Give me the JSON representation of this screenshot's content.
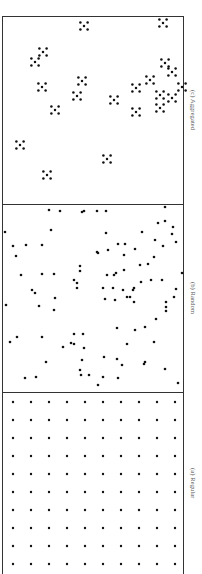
{
  "figure": {
    "panels": [
      {
        "id": "c",
        "label": "(c) Aggregated",
        "pattern": "aggregated",
        "cluster_centers_px": [
          [
            84,
            26
          ],
          [
            43,
            52
          ],
          [
            35,
            62
          ],
          [
            42,
            87
          ],
          [
            82,
            81
          ],
          [
            77,
            96
          ],
          [
            55,
            110
          ],
          [
            20,
            145
          ],
          [
            47,
            175
          ],
          [
            107,
            159
          ],
          [
            114,
            100
          ],
          [
            136,
            88
          ],
          [
            136,
            112
          ],
          [
            150,
            80
          ],
          [
            165,
            63
          ],
          [
            172,
            72
          ],
          [
            160,
            95
          ],
          [
            160,
            108
          ],
          [
            172,
            98
          ],
          [
            182,
            87
          ],
          [
            163,
            23
          ]
        ],
        "cluster_shape": "quincunx-5"
      },
      {
        "id": "b",
        "label": "(b) Random",
        "pattern": "random",
        "points_px": [
          [
            49,
            210
          ],
          [
            60,
            211
          ],
          [
            82,
            212
          ],
          [
            84,
            211
          ],
          [
            97,
            211
          ],
          [
            106,
            211
          ],
          [
            165,
            207
          ],
          [
            5,
            232
          ],
          [
            51,
            230
          ],
          [
            142,
            232
          ],
          [
            13,
            246
          ],
          [
            26,
            245
          ],
          [
            42,
            245
          ],
          [
            16,
            256
          ],
          [
            158,
            223
          ],
          [
            165,
            221
          ],
          [
            173,
            227
          ],
          [
            106,
            233
          ],
          [
            118,
            244
          ],
          [
            125,
            244
          ],
          [
            155,
            240
          ],
          [
            163,
            246
          ],
          [
            172,
            234
          ],
          [
            176,
            242
          ],
          [
            108,
            250
          ],
          [
            98,
            253
          ],
          [
            124,
            255
          ],
          [
            135,
            249
          ],
          [
            97,
            252
          ],
          [
            21,
            275
          ],
          [
            42,
            274
          ],
          [
            54,
            274
          ],
          [
            80,
            266
          ],
          [
            80,
            271
          ],
          [
            74,
            280
          ],
          [
            77,
            283
          ],
          [
            77,
            288
          ],
          [
            116,
            273
          ],
          [
            140,
            265
          ],
          [
            148,
            264
          ],
          [
            154,
            257
          ],
          [
            124,
            270
          ],
          [
            114,
            275
          ],
          [
            107,
            275
          ],
          [
            151,
            280
          ],
          [
            162,
            280
          ],
          [
            182,
            273
          ],
          [
            32,
            290
          ],
          [
            35,
            293
          ],
          [
            55,
            298
          ],
          [
            103,
            288
          ],
          [
            113,
            288
          ],
          [
            123,
            290
          ],
          [
            134,
            288
          ],
          [
            141,
            282
          ],
          [
            133,
            290
          ],
          [
            176,
            289
          ],
          [
            174,
            297
          ],
          [
            127,
            297
          ],
          [
            130,
            297
          ],
          [
            6,
            305
          ],
          [
            39,
            306
          ],
          [
            54,
            310
          ],
          [
            105,
            299
          ],
          [
            115,
            300
          ],
          [
            134,
            302
          ],
          [
            166,
            302
          ],
          [
            166,
            307
          ],
          [
            166,
            311
          ],
          [
            17,
            337
          ],
          [
            10,
            342
          ],
          [
            42,
            337
          ],
          [
            74,
            334
          ],
          [
            83,
            334
          ],
          [
            71,
            343
          ],
          [
            74,
            344
          ],
          [
            84,
            348
          ],
          [
            63,
            347
          ],
          [
            156,
            319
          ],
          [
            135,
            330
          ],
          [
            145,
            327
          ],
          [
            117,
            328
          ],
          [
            127,
            344
          ],
          [
            154,
            342
          ],
          [
            46,
            362
          ],
          [
            82,
            360
          ],
          [
            104,
            357
          ],
          [
            117,
            359
          ],
          [
            145,
            362
          ],
          [
            122,
            365
          ],
          [
            144,
            364
          ],
          [
            165,
            369
          ],
          [
            80,
            370
          ],
          [
            81,
            375
          ],
          [
            89,
            375
          ],
          [
            25,
            378
          ],
          [
            36,
            377
          ],
          [
            103,
            377
          ],
          [
            118,
            378
          ],
          [
            178,
            383
          ],
          [
            98,
            385
          ]
        ]
      },
      {
        "id": "a",
        "label": "(a) Regular",
        "pattern": "regular",
        "grid": {
          "columns_x_px": [
            13,
            31,
            49,
            67,
            85,
            103,
            121,
            139,
            157,
            175
          ],
          "rows_y_px": [
            402,
            420,
            438,
            456,
            474,
            492,
            510,
            528,
            546,
            564
          ]
        }
      }
    ]
  },
  "labels": {
    "c": "(c) Aggregated",
    "b": "(b) Random",
    "a": "(a) Regular"
  },
  "colors": {
    "dot": "#111111",
    "frame": "#333333",
    "label": "#555555"
  }
}
